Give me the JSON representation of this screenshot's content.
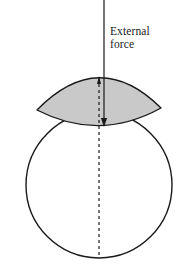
{
  "figure": {
    "labels": {
      "external_force_line1": "External",
      "external_force_line2": "force"
    },
    "colors": {
      "background": "#ffffff",
      "stroke": "#1a1a1a",
      "shaded_fill": "#c9c9c9",
      "shaded_stroke": "#1a1a1a",
      "dashed_stroke": "#1a1a1a",
      "text": "#1a1a1a"
    },
    "geometry": {
      "canvas_width": 196,
      "canvas_height": 269,
      "circle": {
        "cx": 99,
        "cy": 185,
        "r": 73,
        "stroke_width": 1.4
      },
      "lens": {
        "left_tip_x": 37,
        "left_tip_y": 110,
        "right_tip_x": 161,
        "right_tip_y": 108,
        "top_apex_x": 99,
        "top_apex_y": 77,
        "bottom_apex_x": 99,
        "bottom_apex_y": 126,
        "stroke_width": 1.4
      },
      "force_arrow": {
        "x": 104,
        "y_start": 0,
        "y_end": 126,
        "stroke_width": 1.2,
        "head_length": 9,
        "head_width": 5,
        "direction": "down"
      },
      "dashed_measure_line": {
        "x": 99,
        "y_top": 78,
        "y_bottom": 258,
        "stroke_width": 1.2,
        "dash_pattern": "3 3",
        "head_length": 8,
        "head_width": 4,
        "direction": "up"
      }
    }
  }
}
